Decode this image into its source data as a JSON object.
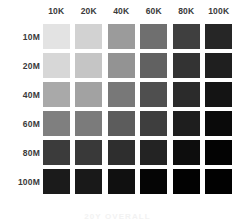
{
  "figure": {
    "background": "#ffffff",
    "label_color": "#3a3a3a",
    "caption": "20Y OVERALL",
    "caption_color": "#f2f2f2"
  },
  "chart_data": {
    "type": "heatmap",
    "title": "",
    "subtitle": "",
    "xlabel": "",
    "ylabel": "",
    "annotations": [
      "20Y OVERALL"
    ],
    "grid": false,
    "legend": "none",
    "colorscale": "grayscale-light-to-dark",
    "columns": [
      "10K",
      "20K",
      "40K",
      "60K",
      "80K",
      "100K"
    ],
    "rows": [
      "10M",
      "20M",
      "40M",
      "60M",
      "80M",
      "100M"
    ],
    "cell_colors": [
      [
        "#e3e3e3",
        "#d2d2d2",
        "#9b9b9b",
        "#6f6f6f",
        "#3f3f3f",
        "#262626"
      ],
      [
        "#d7d7d7",
        "#c5c5c5",
        "#939393",
        "#616161",
        "#333333",
        "#1f1f1f"
      ],
      [
        "#a9a9a9",
        "#a2a2a2",
        "#787878",
        "#4f4f4f",
        "#2b2b2b",
        "#141414"
      ],
      [
        "#7f7f7f",
        "#7b7b7b",
        "#5c5c5c",
        "#3e3e3e",
        "#1e1e1e",
        "#0a0a0a"
      ],
      [
        "#3b3b3b",
        "#393939",
        "#2e2e2e",
        "#232323",
        "#0d0d0d",
        "#030303"
      ],
      [
        "#1b1b1b",
        "#191919",
        "#101010",
        "#050505",
        "#020202",
        "#010101"
      ]
    ],
    "values": [
      [
        224,
        210,
        155,
        111,
        63,
        38
      ],
      [
        215,
        197,
        147,
        97,
        51,
        31
      ],
      [
        169,
        162,
        120,
        79,
        43,
        20
      ],
      [
        127,
        123,
        92,
        62,
        30,
        10
      ],
      [
        59,
        57,
        46,
        35,
        13,
        3
      ],
      [
        27,
        25,
        16,
        5,
        2,
        1
      ]
    ]
  }
}
